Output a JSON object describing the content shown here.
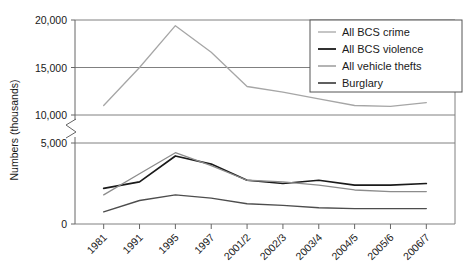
{
  "chart_data": {
    "type": "line",
    "title": "",
    "xlabel": "",
    "ylabel": "Numbers (thousands)",
    "categories": [
      "1981",
      "1991",
      "1995",
      "1997",
      "2001/2",
      "2002/3",
      "2003/4",
      "2004/5",
      "2005/6",
      "2006/7"
    ],
    "ytick_labels": [
      "0",
      "5,000",
      "10,000",
      "15,000",
      "20,000"
    ],
    "ytick_values": [
      0,
      5000,
      10000,
      15000,
      20000
    ],
    "ylim": [
      0,
      20000
    ],
    "axis_break": "between 5,000 and 10,000",
    "grid": true,
    "legend_position": "top-right",
    "series": [
      {
        "name": "All BCS crime",
        "color": "#a6a6a6",
        "values": [
          11000,
          15000,
          19400,
          16600,
          13000,
          12400,
          11700,
          11000,
          10900,
          11300
        ]
      },
      {
        "name": "All BCS violence",
        "color": "#1a1a1a",
        "values": [
          2200,
          2600,
          4200,
          3700,
          2700,
          2500,
          2700,
          2400,
          2400,
          2500
        ]
      },
      {
        "name": "All vehicle thefts",
        "color": "#8c8c8c",
        "values": [
          1800,
          3100,
          4400,
          3600,
          2700,
          2600,
          2400,
          2100,
          2000,
          2000
        ]
      },
      {
        "name": "Burglary",
        "color": "#4d4d4d",
        "values": [
          750,
          1450,
          1800,
          1600,
          1250,
          1150,
          1000,
          950,
          950,
          950
        ]
      }
    ]
  },
  "legend": {
    "items": [
      {
        "label": "All BCS crime",
        "color": "#a6a6a6"
      },
      {
        "label": "All BCS violence",
        "color": "#1a1a1a"
      },
      {
        "label": "All vehicle thefts",
        "color": "#8c8c8c"
      },
      {
        "label": "Burglary",
        "color": "#4d4d4d"
      }
    ]
  }
}
